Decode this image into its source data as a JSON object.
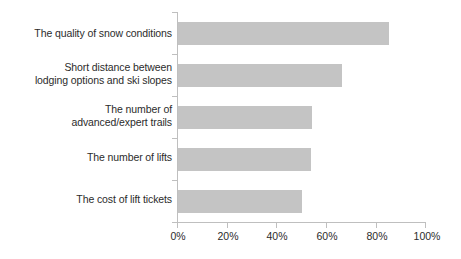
{
  "chart_data": {
    "type": "bar",
    "orientation": "horizontal",
    "title": "",
    "subtitle": "",
    "xlabel": "",
    "ylabel": "",
    "categories": [
      "The quality of snow conditions",
      "Short distance between\nlodging options and ski slopes",
      "The number of\nadvanced/expert trails",
      "The number of lifts",
      "The cost of lift tickets"
    ],
    "values": [
      85,
      66,
      54,
      53.5,
      50
    ],
    "value_suffix": "%",
    "xlim": [
      0,
      100
    ],
    "xticks": [
      0,
      20,
      40,
      60,
      80,
      100
    ],
    "xtick_labels": [
      "0%",
      "20%",
      "40%",
      "60%",
      "80%",
      "100%"
    ],
    "grid": false,
    "legend": null,
    "bar_color": "#c4c4c4",
    "axis_color": "#bfbfbf",
    "text_color": "#2b2b2b"
  }
}
